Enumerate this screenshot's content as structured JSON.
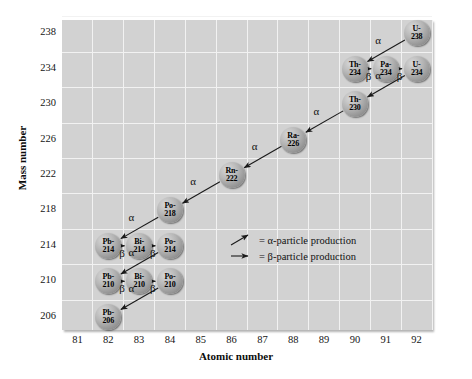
{
  "chart_data": {
    "type": "scatter",
    "title": "",
    "xlabel": "Atomic number",
    "ylabel": "Mass number",
    "xlim": [
      80.5,
      92.5
    ],
    "ylim": [
      204.5,
      239.5
    ],
    "xticks": [
      81,
      82,
      83,
      84,
      85,
      86,
      87,
      88,
      89,
      90,
      91,
      92
    ],
    "yticks": [
      206,
      210,
      214,
      218,
      222,
      226,
      230,
      234,
      238
    ],
    "grid": true,
    "legend_position": "inside-center-right",
    "nodes": [
      {
        "id": "U-238",
        "element": "U-",
        "mass": "238",
        "x": 92,
        "y": 238
      },
      {
        "id": "Th-234",
        "element": "Th-",
        "mass": "234",
        "x": 90,
        "y": 234
      },
      {
        "id": "Pa-234",
        "element": "Pa-",
        "mass": "234",
        "x": 91,
        "y": 234
      },
      {
        "id": "U-234",
        "element": "U-",
        "mass": "234",
        "x": 92,
        "y": 234
      },
      {
        "id": "Th-230",
        "element": "Th-",
        "mass": "230",
        "x": 90,
        "y": 230
      },
      {
        "id": "Ra-226",
        "element": "Ra-",
        "mass": "226",
        "x": 88,
        "y": 226
      },
      {
        "id": "Rn-222",
        "element": "Rn-",
        "mass": "222",
        "x": 86,
        "y": 222
      },
      {
        "id": "Po-218",
        "element": "Po-",
        "mass": "218",
        "x": 84,
        "y": 218
      },
      {
        "id": "Pb-214",
        "element": "Pb-",
        "mass": "214",
        "x": 82,
        "y": 214
      },
      {
        "id": "Bi-214",
        "element": "Bi-",
        "mass": "214",
        "x": 83,
        "y": 214
      },
      {
        "id": "Po-214",
        "element": "Po-",
        "mass": "214",
        "x": 84,
        "y": 214
      },
      {
        "id": "Pb-210",
        "element": "Pb-",
        "mass": "210",
        "x": 82,
        "y": 210
      },
      {
        "id": "Bi-210",
        "element": "Bi-",
        "mass": "210",
        "x": 83,
        "y": 210
      },
      {
        "id": "Po-210",
        "element": "Po-",
        "mass": "210",
        "x": 84,
        "y": 210
      },
      {
        "id": "Pb-206",
        "element": "Pb-",
        "mass": "206",
        "x": 82,
        "y": 206
      }
    ],
    "decays": [
      {
        "from": "U-238",
        "to": "Th-234",
        "type": "alpha",
        "label": "α"
      },
      {
        "from": "Th-234",
        "to": "Pa-234",
        "type": "beta",
        "label": "β"
      },
      {
        "from": "Pa-234",
        "to": "U-234",
        "type": "beta",
        "label": "β"
      },
      {
        "from": "U-234",
        "to": "Th-230",
        "type": "alpha",
        "label": "α"
      },
      {
        "from": "Th-230",
        "to": "Ra-226",
        "type": "alpha",
        "label": "α"
      },
      {
        "from": "Ra-226",
        "to": "Rn-222",
        "type": "alpha",
        "label": "α"
      },
      {
        "from": "Rn-222",
        "to": "Po-218",
        "type": "alpha",
        "label": "α"
      },
      {
        "from": "Po-218",
        "to": "Pb-214",
        "type": "alpha",
        "label": "α"
      },
      {
        "from": "Pb-214",
        "to": "Bi-214",
        "type": "beta",
        "label": "β"
      },
      {
        "from": "Bi-214",
        "to": "Po-214",
        "type": "beta",
        "label": "β"
      },
      {
        "from": "Po-214",
        "to": "Pb-210",
        "type": "alpha",
        "label": "α"
      },
      {
        "from": "Pb-210",
        "to": "Bi-210",
        "type": "beta",
        "label": "β"
      },
      {
        "from": "Bi-210",
        "to": "Po-210",
        "type": "beta",
        "label": "β"
      },
      {
        "from": "Po-210",
        "to": "Pb-206",
        "type": "alpha",
        "label": "α"
      }
    ],
    "legend": [
      {
        "glyph": "diagonal-arrow",
        "text": "= α-particle production"
      },
      {
        "glyph": "horizontal-arrow",
        "text": "= β-particle production"
      }
    ],
    "colors": {
      "plot_background": "#d2d2d2",
      "gridline": "#f2f2f2",
      "node_fill": "#a8a8a8",
      "arrow": "#1a1a1a",
      "text": "#111111"
    }
  },
  "axes": {
    "x_label": "Atomic number",
    "y_label": "Mass number"
  }
}
